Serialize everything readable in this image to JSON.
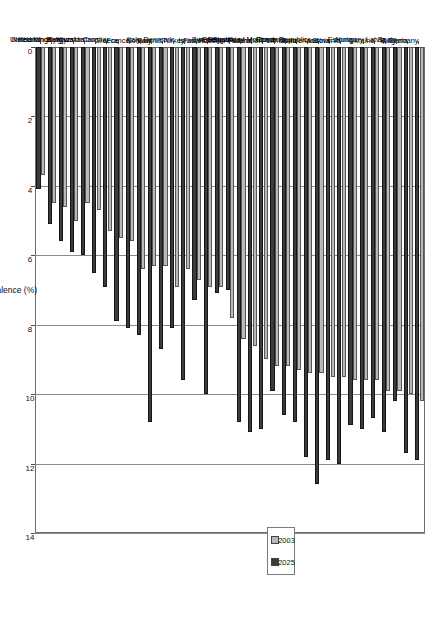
{
  "chart_data": {
    "type": "bar",
    "title": "",
    "xlabel": "",
    "ylabel": "Prevalence (%)",
    "ylim": [
      0,
      14
    ],
    "yticks": [
      0,
      2,
      4,
      6,
      8,
      10,
      12,
      14
    ],
    "grid": true,
    "legend_position": "top-center",
    "orientation": "rotated-90",
    "categories": [
      "Germany",
      "Bulgaria",
      "Spain",
      "Latvia",
      "Ukraine",
      "Hungary",
      "Estonia",
      "Slovenia",
      "Austria",
      "Switzerland",
      "Czech Republic",
      "Lithuania",
      "Romania",
      "Republic of Moldova",
      "Russian Federation",
      "Poland",
      "Slovakia",
      "Portugal",
      "Sweden",
      "Finland",
      "Israel",
      "Turkey",
      "Denmark",
      "Belarus",
      "Norway",
      "Italy",
      "France",
      "Greece",
      "Croatia",
      "Kazakhstan",
      "Kyrgyzstan",
      "Belgium",
      "United Kingdom",
      "Netherlands",
      "Ireland"
    ],
    "series": [
      {
        "name": "2003",
        "color": "#b9b9b9",
        "values": [
          10.2,
          10.0,
          9.9,
          9.9,
          9.6,
          9.6,
          9.6,
          9.5,
          9.5,
          9.4,
          9.4,
          9.3,
          9.2,
          9.2,
          9.0,
          8.6,
          8.4,
          7.8,
          6.9,
          6.9,
          6.7,
          6.4,
          6.9,
          6.3,
          6.3,
          6.4,
          5.6,
          5.5,
          5.3,
          4.7,
          4.5,
          5.0,
          4.6,
          4.5,
          3.7
        ]
      },
      {
        "name": "2025",
        "color": "#3b3b3b",
        "values": [
          11.9,
          11.7,
          10.2,
          11.1,
          10.7,
          11.0,
          10.9,
          12.0,
          11.9,
          12.6,
          11.8,
          10.8,
          10.6,
          9.9,
          11.0,
          11.1,
          10.8,
          7.0,
          7.1,
          10.0,
          7.3,
          9.6,
          8.1,
          8.7,
          10.8,
          8.3,
          8.1,
          7.9,
          6.9,
          6.5,
          6.0,
          5.9,
          5.6,
          5.1,
          4.1
        ]
      }
    ]
  },
  "legend": {
    "items": [
      {
        "label": "2003"
      },
      {
        "label": "2025"
      }
    ]
  },
  "axis": {
    "value_title": "Prevalence (%)"
  }
}
